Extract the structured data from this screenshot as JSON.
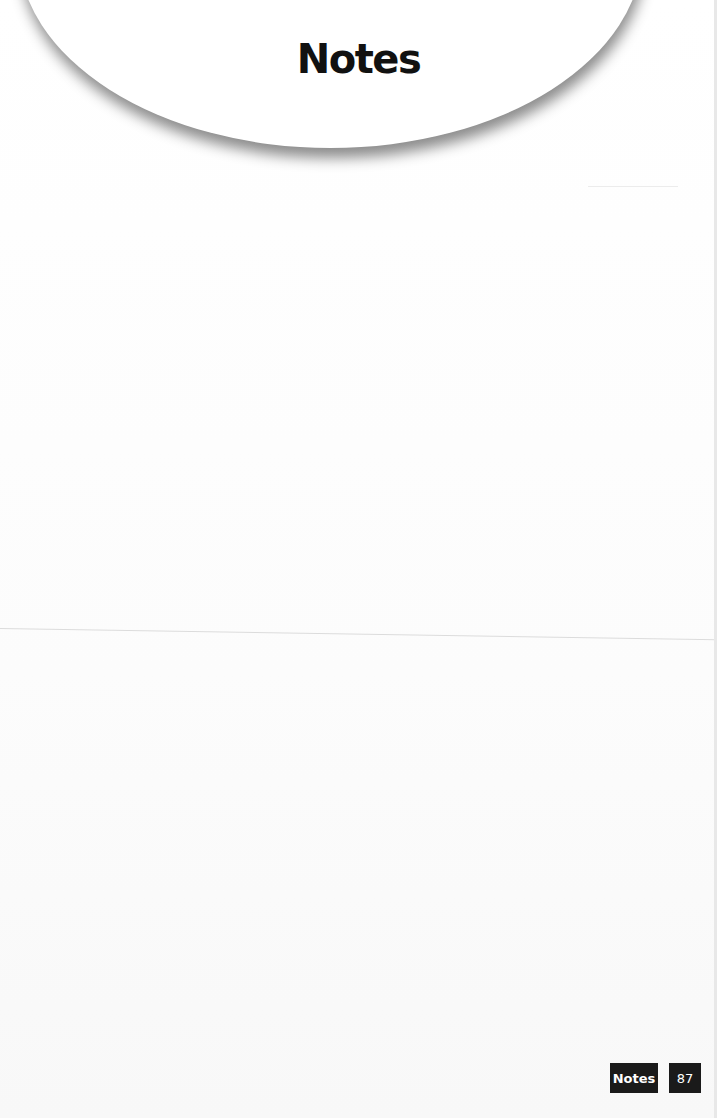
{
  "header": {
    "title": "Notes"
  },
  "footer": {
    "section_label": "Notes",
    "page_number": "87"
  }
}
